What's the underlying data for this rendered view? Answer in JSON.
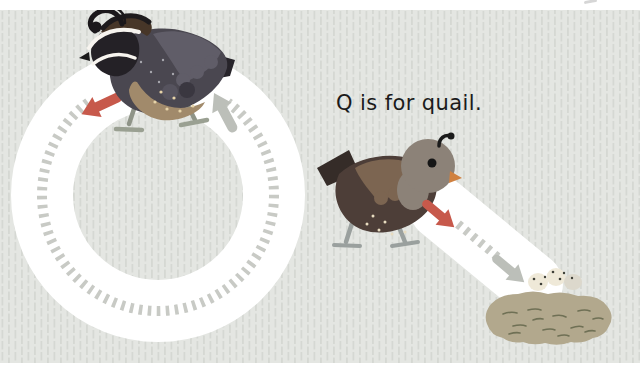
{
  "caption": {
    "text": "Q is for quail."
  },
  "letter": {
    "character": "Q",
    "word": "quail"
  },
  "colors": {
    "page_background": "#ffffff",
    "scene_background": "#e4e6e2",
    "scene_texture_dash": "#d5d8d3",
    "letter_stroke": "#ffffff",
    "guide_dash": "#c8cac5",
    "start_arrow": "#c7594b",
    "end_arrow": "#bcbfb9",
    "caption_text": "#1b1b1b",
    "male_quail": {
      "body": "#4a4750",
      "head": "#242126",
      "crown": "#473628",
      "wing": "#605d68",
      "belly": "#a18a6b",
      "tail": "#27242a",
      "stripe": "#f7f4ef",
      "legs": "#8f9488",
      "feet": "#9aa092"
    },
    "female_quail": {
      "body": "#4d3e38",
      "head": "#8c8278",
      "wing": "#7c6551",
      "tail": "#352c28",
      "beak": "#d08140",
      "plume": "#1b1b1b",
      "legs": "#9aa09e"
    },
    "nest": {
      "body": "#b2a88d",
      "texture": "#6f7055",
      "egg": "#efe9d8",
      "egg_shadow": "#dcd8cc",
      "egg_speckle": "#3f4038"
    }
  },
  "tracing": {
    "shape": "letter Q",
    "stroke_count": "2",
    "stroke1_guide": "circle with dashed guide, start arrow top-left, end arrow top-right",
    "stroke2_guide": "diagonal tail from quail down-right into nest"
  }
}
